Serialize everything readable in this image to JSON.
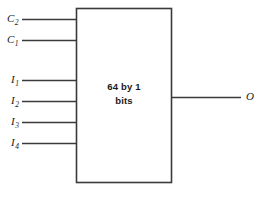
{
  "diagram": {
    "block": {
      "label_line1": "64 by 1",
      "label_line2": "bits",
      "x": 76,
      "y": 8,
      "width": 96,
      "height": 175,
      "stroke_color": "#3a3a3a",
      "fill_color": "#ffffff"
    },
    "inputs": [
      {
        "name": "C2",
        "base": "C",
        "subscript": "2",
        "y": 19,
        "line_x1": 22,
        "line_x2": 76
      },
      {
        "name": "C1",
        "base": "C",
        "subscript": "1",
        "y": 40,
        "line_x1": 22,
        "line_x2": 76
      },
      {
        "name": "I1",
        "base": "I",
        "subscript": "1",
        "y": 80,
        "line_x1": 22,
        "line_x2": 76
      },
      {
        "name": "I2",
        "base": "I",
        "subscript": "2",
        "y": 101,
        "line_x1": 22,
        "line_x2": 76
      },
      {
        "name": "I3",
        "base": "I",
        "subscript": "3",
        "y": 122,
        "line_x1": 22,
        "line_x2": 76
      },
      {
        "name": "I4",
        "base": "I",
        "subscript": "4",
        "y": 143,
        "line_x1": 22,
        "line_x2": 76
      }
    ],
    "output": {
      "name": "O",
      "base": "O",
      "subscript": "",
      "y": 97,
      "line_x1": 172,
      "line_x2": 241
    },
    "colors": {
      "line": "#3a3a3a",
      "text": "#1a1a1a",
      "background": "#ffffff"
    }
  }
}
